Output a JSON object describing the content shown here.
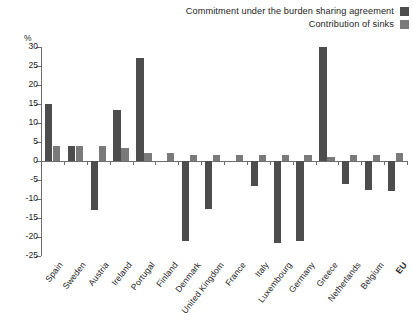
{
  "chart_data": {
    "type": "bar",
    "title": "",
    "subtitle": "",
    "xlabel": "",
    "ylabel": "%",
    "ylim": [
      -25,
      30
    ],
    "ytick_step": 5,
    "yticks": [
      30,
      25,
      20,
      15,
      10,
      5,
      0,
      -5,
      -10,
      -15,
      -20,
      -25
    ],
    "ytick_labels": [
      "30",
      "25",
      "20",
      "15",
      "10",
      "5",
      "0",
      "-5",
      "-10",
      "-15",
      "-20",
      "-25"
    ],
    "grid": false,
    "legend_position": "top-right",
    "categories": [
      "Spain",
      "Sweden",
      "Austria",
      "Ireland",
      "Portugal",
      "Finland",
      "Denmark",
      "United Kingdom",
      "France",
      "Italy",
      "Luxembourg",
      "Germany",
      "Greece",
      "Netherlands",
      "Belgium",
      "EU"
    ],
    "emphasized_categories": [
      "EU"
    ],
    "series": [
      {
        "name": "Commitment under the burden sharing agreement",
        "color": "#4d4d4d",
        "values": [
          15.0,
          4.0,
          -13.0,
          13.5,
          27.0,
          0.0,
          -21.0,
          -12.5,
          0.0,
          -6.5,
          -21.5,
          -21.0,
          30.0,
          -6.0,
          -7.5,
          -8.0
        ]
      },
      {
        "name": "Contribution of sinks",
        "color": "#7a7a7a",
        "values": [
          4.0,
          4.0,
          4.0,
          3.5,
          2.0,
          2.0,
          1.5,
          1.5,
          1.5,
          1.5,
          1.5,
          1.5,
          1.0,
          1.5,
          1.5,
          2.0
        ]
      }
    ]
  },
  "legend": {
    "items": [
      {
        "label": "Commitment under the burden sharing agreement",
        "swatch_color": "#4d4d4d"
      },
      {
        "label": "Contribution of sinks",
        "swatch_color": "#7a7a7a"
      }
    ]
  },
  "axis": {
    "unit_label": "%"
  }
}
